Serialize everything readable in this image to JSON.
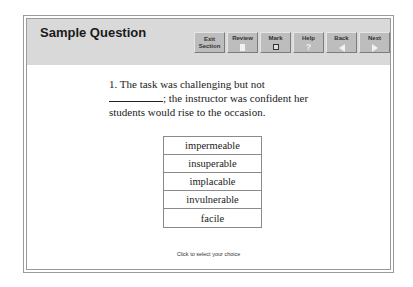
{
  "header": {
    "title": "Sample Question"
  },
  "toolbar": {
    "buttons": [
      {
        "label_line1": "Exit",
        "label_line2": "Section",
        "icon": "none"
      },
      {
        "label": "Review",
        "icon": "document-icon"
      },
      {
        "label": "Mark",
        "icon": "checkbox-icon"
      },
      {
        "label": "Help",
        "icon": "question-mark-icon"
      },
      {
        "label": "Back",
        "icon": "left-arrow-icon"
      },
      {
        "label": "Next",
        "icon": "right-arrow-icon"
      }
    ]
  },
  "question": {
    "number": "1.",
    "text_before_blank": "The task was challenging but not",
    "text_after_blank": ";",
    "text_rest": "the instructor was confident her students would rise to the occasion."
  },
  "choices": [
    "impermeable",
    "insuperable",
    "implacable",
    "invulnerable",
    "facile"
  ],
  "hint": "Click to select your choice",
  "colors": {
    "header_bg": "#d9d9d9",
    "button_bg": "#bdbdbd",
    "border": "#9a9a9a"
  }
}
